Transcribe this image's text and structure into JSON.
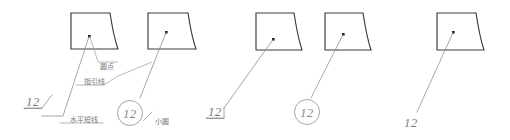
{
  "diagram": {
    "background_color": "#ffffff",
    "shape_stroke_color": "#3a3a3a",
    "leader_stroke_color": "#8a8a8a",
    "dot_color": "#1c1c1c",
    "label_color": "#7a7a7a"
  },
  "callouts": {
    "dot": "圆点",
    "leader_line": "指引线",
    "horizontal_short_line": "水平短线",
    "small_circle": "小圆"
  },
  "numbers": {
    "underlined_1": "12",
    "circled_1": "12",
    "underlined_2": "12",
    "circled_2": "12",
    "plain_3": "12"
  },
  "groups": [
    {
      "name": "group-annotated",
      "shapes": [
        "shape-1",
        "shape-2"
      ],
      "labels": [
        "圆点",
        "指引线",
        "水平短线",
        "小圆"
      ],
      "numbers": [
        "12",
        "12"
      ]
    },
    {
      "name": "group-plain",
      "shapes": [
        "shape-3",
        "shape-4"
      ],
      "labels": [],
      "numbers": [
        "12",
        "12"
      ]
    },
    {
      "name": "group-single",
      "shapes": [
        "shape-5"
      ],
      "labels": [],
      "numbers": [
        "12"
      ]
    }
  ]
}
